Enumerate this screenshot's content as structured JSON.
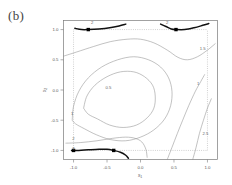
{
  "panel": {
    "label": "(b)"
  },
  "chart_data": {
    "type": "line",
    "title": "",
    "xlabel": "x1",
    "ylabel": "x2",
    "xlim": [
      -1.15,
      1.15
    ],
    "ylim": [
      -1.15,
      1.15
    ],
    "grid": false,
    "legend": "none",
    "xticks": [
      "-1.0",
      "-0.5",
      "0.0",
      "0.5",
      "1.0"
    ],
    "xtick_values": [
      -1.0,
      -0.5,
      0.0,
      0.5,
      1.0
    ],
    "yticks": [
      "-1.0",
      "-0.5",
      "0.0",
      "0.5",
      "1.0"
    ],
    "ytick_values": [
      -1.0,
      -0.5,
      0.0,
      0.5,
      1.0
    ],
    "contour_labels": [
      {
        "text": "0.5",
        "x": -0.48,
        "y": 0.02
      },
      {
        "text": "1",
        "x": -1.02,
        "y": -0.42
      },
      {
        "text": "1",
        "x": 0.86,
        "y": 0.08
      },
      {
        "text": "1.5",
        "x": 0.93,
        "y": 0.66
      },
      {
        "text": "2",
        "x": -1.0,
        "y": -0.83
      },
      {
        "text": "2",
        "x": -0.72,
        "y": 1.1
      },
      {
        "text": "2",
        "x": 0.4,
        "y": 1.1
      },
      {
        "text": "2.5",
        "x": 0.97,
        "y": -0.75
      },
      {
        "text": "3",
        "x": -1.0,
        "y": -1.0
      }
    ],
    "reference_lines": [
      {
        "orientation": "horizontal",
        "value": 1.0,
        "style": "dotted"
      },
      {
        "orientation": "horizontal",
        "value": -1.0,
        "style": "dotted"
      },
      {
        "orientation": "vertical",
        "value": -1.0,
        "style": "dotted"
      },
      {
        "orientation": "vertical",
        "value": 1.0,
        "style": "dotted"
      }
    ],
    "markers": [
      {
        "x": -0.78,
        "y": 1.0
      },
      {
        "x": 0.53,
        "y": 1.0
      },
      {
        "x": -1.0,
        "y": -1.0
      },
      {
        "x": -0.4,
        "y": -1.0
      }
    ],
    "series": [
      {
        "name": "bold-top-left",
        "style": "bold",
        "points": [
          [
            -0.98,
            1.02
          ],
          [
            -0.88,
            1.0
          ],
          [
            -0.78,
            1.0
          ],
          [
            -0.62,
            1.01
          ],
          [
            -0.46,
            1.03
          ],
          [
            -0.32,
            1.06
          ],
          [
            -0.22,
            1.09
          ]
        ]
      },
      {
        "name": "bold-top-right",
        "style": "bold",
        "points": [
          [
            0.3,
            1.09
          ],
          [
            0.38,
            1.05
          ],
          [
            0.46,
            1.01
          ],
          [
            0.53,
            1.0
          ],
          [
            0.66,
            1.0
          ],
          [
            0.8,
            1.03
          ],
          [
            0.93,
            1.07
          ],
          [
            1.02,
            1.1
          ]
        ]
      },
      {
        "name": "bold-bottom",
        "style": "bold",
        "points": [
          [
            -1.03,
            -1.0
          ],
          [
            -0.92,
            -1.0
          ],
          [
            -0.78,
            -0.99
          ],
          [
            -0.62,
            -0.98
          ],
          [
            -0.5,
            -0.98
          ],
          [
            -0.4,
            -1.0
          ],
          [
            -0.3,
            -1.03
          ],
          [
            -0.22,
            -1.08
          ],
          [
            -0.18,
            -1.13
          ]
        ]
      },
      {
        "name": "contour-upper-sweep",
        "style": "thin",
        "points": [
          [
            -1.15,
            0.56
          ],
          [
            -0.95,
            0.63
          ],
          [
            -0.7,
            0.72
          ],
          [
            -0.45,
            0.8
          ],
          [
            -0.2,
            0.84
          ],
          [
            0.0,
            0.84
          ],
          [
            0.2,
            0.78
          ],
          [
            0.4,
            0.66
          ],
          [
            0.56,
            0.54
          ],
          [
            0.7,
            0.5
          ],
          [
            0.85,
            0.55
          ],
          [
            1.0,
            0.66
          ],
          [
            1.12,
            0.77
          ]
        ]
      },
      {
        "name": "contour-ellipse-outer",
        "style": "thin",
        "points": [
          [
            -1.02,
            -0.5
          ],
          [
            -1.0,
            -0.27
          ],
          [
            -0.92,
            -0.02
          ],
          [
            -0.78,
            0.2
          ],
          [
            -0.58,
            0.38
          ],
          [
            -0.34,
            0.5
          ],
          [
            -0.1,
            0.55
          ],
          [
            0.12,
            0.5
          ],
          [
            0.3,
            0.38
          ],
          [
            0.42,
            0.2
          ],
          [
            0.47,
            -0.02
          ],
          [
            0.45,
            -0.26
          ],
          [
            0.36,
            -0.48
          ],
          [
            0.2,
            -0.66
          ],
          [
            0.0,
            -0.78
          ],
          [
            -0.22,
            -0.84
          ],
          [
            -0.45,
            -0.82
          ],
          [
            -0.66,
            -0.74
          ],
          [
            -0.84,
            -0.64
          ],
          [
            -0.97,
            -0.56
          ],
          [
            -1.02,
            -0.5
          ]
        ]
      },
      {
        "name": "contour-ellipse-inner",
        "style": "thin",
        "points": [
          [
            -0.85,
            -0.3
          ],
          [
            -0.8,
            -0.1
          ],
          [
            -0.68,
            0.08
          ],
          [
            -0.5,
            0.22
          ],
          [
            -0.3,
            0.3
          ],
          [
            -0.1,
            0.3
          ],
          [
            0.06,
            0.22
          ],
          [
            0.18,
            0.08
          ],
          [
            0.22,
            -0.1
          ],
          [
            0.2,
            -0.3
          ],
          [
            0.1,
            -0.46
          ],
          [
            -0.06,
            -0.58
          ],
          [
            -0.26,
            -0.62
          ],
          [
            -0.46,
            -0.58
          ],
          [
            -0.64,
            -0.48
          ],
          [
            -0.78,
            -0.4
          ],
          [
            -0.85,
            -0.3
          ]
        ]
      },
      {
        "name": "contour-lower-band",
        "style": "thin",
        "points": [
          [
            -1.12,
            -0.88
          ],
          [
            -0.9,
            -0.87
          ],
          [
            -0.65,
            -0.84
          ],
          [
            -0.42,
            -0.8
          ],
          [
            -0.22,
            -0.78
          ],
          [
            -0.08,
            -0.8
          ],
          [
            0.02,
            -0.86
          ],
          [
            0.08,
            -0.98
          ],
          [
            0.1,
            -1.12
          ]
        ]
      },
      {
        "name": "contour-bottom-right-1",
        "style": "thin",
        "points": [
          [
            0.4,
            -1.15
          ],
          [
            0.47,
            -0.95
          ],
          [
            0.55,
            -0.72
          ],
          [
            0.63,
            -0.5
          ],
          [
            0.72,
            -0.26
          ],
          [
            0.82,
            -0.02
          ],
          [
            0.9,
            0.14
          ],
          [
            0.96,
            0.26
          ]
        ]
      },
      {
        "name": "contour-bottom-right-2",
        "style": "thin",
        "points": [
          [
            0.78,
            -1.15
          ],
          [
            0.83,
            -0.95
          ],
          [
            0.88,
            -0.72
          ],
          [
            0.94,
            -0.5
          ],
          [
            1.0,
            -0.3
          ],
          [
            1.06,
            -0.14
          ]
        ]
      }
    ]
  }
}
